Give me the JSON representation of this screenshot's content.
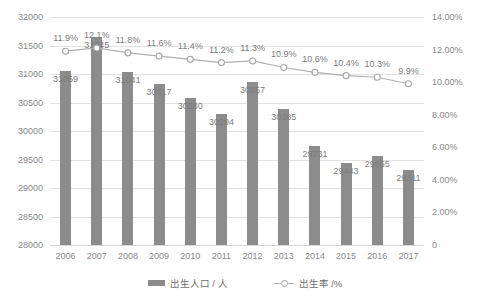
{
  "chart_data": {
    "type": "bar",
    "title": "",
    "subtitle": "",
    "xlabel": "",
    "ylabel": "",
    "categories": [
      "2006",
      "2007",
      "2008",
      "2009",
      "2010",
      "2011",
      "2012",
      "2013",
      "2014",
      "2015",
      "2016",
      "2017"
    ],
    "series": [
      {
        "name": "出生人口 / 人",
        "type": "bar",
        "axis": "left",
        "values": [
          31059,
          31645,
          31041,
          30817,
          30580,
          30294,
          30857,
          30385,
          29731,
          29443,
          29565,
          29311
        ],
        "labels": [
          "31059",
          "31645",
          "31041",
          "30817",
          "30580",
          "30294",
          "30857",
          "30385",
          "29731",
          "29443",
          "29565",
          "29311"
        ],
        "color": "#8c8c8c"
      },
      {
        "name": "出生率 /%",
        "type": "line",
        "axis": "right",
        "values": [
          11.9,
          12.1,
          11.8,
          11.6,
          11.4,
          11.2,
          11.3,
          10.9,
          10.6,
          10.4,
          10.3,
          9.9
        ],
        "labels": [
          "11.9%",
          "12.1%",
          "11.8%",
          "11.6%",
          "11.4%",
          "11.2%",
          "11.3%",
          "10.9%",
          "10.6%",
          "10.4%",
          "10.3%",
          "9.9%"
        ],
        "color": "#b0b0b0",
        "marker": "open-circle"
      }
    ],
    "y_left": {
      "min": 28000,
      "max": 32000,
      "step": 500,
      "ticks": [
        "28000",
        "28500",
        "29000",
        "29500",
        "30000",
        "30500",
        "31000",
        "31500",
        "32000"
      ]
    },
    "y_right": {
      "min": 0,
      "max": 14,
      "step": 2,
      "ticks": [
        "0",
        "2.00%",
        "4.00%",
        "6.00%",
        "8.00%",
        "10.00%",
        "12.00%",
        "14.00%"
      ]
    },
    "grid": true,
    "legend": {
      "position": "bottom",
      "entries": [
        {
          "label": "出生人口 / 人",
          "marker": "bar-swatch"
        },
        {
          "label": "出生率 /%",
          "marker": "line-swatch"
        }
      ]
    }
  }
}
